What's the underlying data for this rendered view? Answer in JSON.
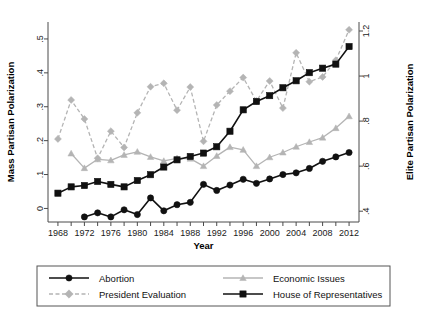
{
  "figure": {
    "background": "#ffffff"
  },
  "axes": {
    "left": {
      "title": "Mass Partisan Polarization",
      "ticks": [
        "0",
        ".1",
        ".2",
        ".3",
        ".4",
        ".5"
      ],
      "values": [
        0,
        0.1,
        0.2,
        0.3,
        0.4,
        0.5
      ],
      "min": -0.04,
      "max": 0.55
    },
    "right": {
      "title": "Elite Partisan Polarization",
      "ticks": [
        ".4",
        ".6",
        ".8",
        "1",
        "1.2"
      ],
      "values": [
        0.4,
        0.6,
        0.8,
        1.0,
        1.2
      ],
      "min": 0.352,
      "max": 1.24
    },
    "bottom": {
      "title": "Year",
      "ticks": [
        "1968",
        "1972",
        "1976",
        "1980",
        "1984",
        "1988",
        "1992",
        "1996",
        "2000",
        "2004",
        "2008",
        "2012"
      ],
      "values": [
        1968,
        1972,
        1976,
        1980,
        1984,
        1988,
        1992,
        1996,
        2000,
        2004,
        2008,
        2012
      ],
      "minor_step": 2,
      "min": 1966.5,
      "max": 2013.5
    }
  },
  "legend": {
    "items": [
      {
        "label": "Abortion",
        "color": "#111111",
        "marker": "circle",
        "dash": "solid",
        "axis": "left"
      },
      {
        "label": "Economic Issues",
        "color": "#b4b4b4",
        "marker": "triangle",
        "dash": "solid",
        "axis": "left"
      },
      {
        "label": "President Evaluation",
        "color": "#b4b4b4",
        "marker": "diamond",
        "dash": "dashed",
        "axis": "left"
      },
      {
        "label": "House of Representatives",
        "color": "#111111",
        "marker": "square",
        "dash": "solid",
        "axis": "right"
      }
    ]
  },
  "chart_data": {
    "type": "line",
    "title": "",
    "xlabel": "Year",
    "ylabel": "Mass Partisan Polarization",
    "y2label": "Elite Partisan Polarization",
    "xlim": [
      1966.5,
      2013.5
    ],
    "ylim": [
      -0.04,
      0.55
    ],
    "y2lim": [
      0.352,
      1.24
    ],
    "grid": false,
    "legend_position": "bottom",
    "x": [
      1968,
      1970,
      1972,
      1974,
      1976,
      1978,
      1980,
      1982,
      1984,
      1986,
      1988,
      1990,
      1992,
      1994,
      1996,
      1998,
      2000,
      2002,
      2004,
      2006,
      2008,
      2010,
      2012
    ],
    "series": [
      {
        "name": "Abortion",
        "axis": "left",
        "color": "#111111",
        "marker": "circle",
        "dash": "solid",
        "x": [
          1972,
          1974,
          1976,
          1978,
          1980,
          1982,
          1984,
          1986,
          1988,
          1990,
          1992,
          1994,
          1996,
          1998,
          2000,
          2002,
          2004,
          2006,
          2008,
          2010,
          2012
        ],
        "values": [
          -0.025,
          -0.013,
          -0.025,
          -0.004,
          -0.018,
          0.031,
          -0.007,
          0.011,
          0.018,
          0.071,
          0.053,
          0.069,
          0.086,
          0.074,
          0.087,
          0.1,
          0.105,
          0.118,
          0.139,
          0.152,
          0.165
        ]
      },
      {
        "name": "Economic Issues",
        "axis": "left",
        "color": "#b4b4b4",
        "marker": "triangle",
        "dash": "solid",
        "x": [
          1970,
          1972,
          1974,
          1976,
          1978,
          1980,
          1982,
          1984,
          1986,
          1988,
          1990,
          1992,
          1994,
          1996,
          1998,
          2000,
          2002,
          2004,
          2006,
          2008,
          2010,
          2012
        ],
        "values": [
          0.162,
          0.119,
          0.145,
          0.142,
          0.158,
          0.167,
          0.152,
          0.14,
          0.148,
          0.147,
          0.125,
          0.155,
          0.181,
          0.173,
          0.125,
          0.151,
          0.165,
          0.182,
          0.196,
          0.209,
          0.237,
          0.272
        ]
      },
      {
        "name": "President Evaluation",
        "axis": "left",
        "color": "#b4b4b4",
        "marker": "diamond",
        "dash": "dashed",
        "x": [
          1968,
          1970,
          1972,
          1974,
          1976,
          1978,
          1980,
          1982,
          1984,
          1986,
          1988,
          1990,
          1992,
          1994,
          1996,
          1998,
          2000,
          2002,
          2004,
          2006,
          2008,
          2010,
          2012
        ],
        "values": [
          0.205,
          0.32,
          0.264,
          0.148,
          0.228,
          0.18,
          0.282,
          0.359,
          0.369,
          0.29,
          0.358,
          0.198,
          0.305,
          0.346,
          0.386,
          0.317,
          0.376,
          0.296,
          0.459,
          0.374,
          0.388,
          0.437,
          0.527
        ]
      },
      {
        "name": "House of Representatives",
        "axis": "right",
        "color": "#111111",
        "marker": "square",
        "dash": "solid",
        "x": [
          1968,
          1970,
          1972,
          1974,
          1976,
          1978,
          1980,
          1982,
          1984,
          1986,
          1988,
          1990,
          1992,
          1994,
          1996,
          1998,
          2000,
          2002,
          2004,
          2006,
          2008,
          2010,
          2012
        ],
        "values_left_scale": [
          0.019,
          0.038,
          0.042,
          0.054,
          0.045,
          0.038,
          0.056,
          0.073,
          0.096,
          0.117,
          0.127,
          0.137,
          0.156,
          0.202,
          0.265,
          0.29,
          0.307,
          0.33,
          0.351,
          0.375,
          0.388,
          0.4,
          0.452
        ],
        "values": [
          0.48,
          0.508,
          0.514,
          0.532,
          0.519,
          0.508,
          0.536,
          0.562,
          0.596,
          0.628,
          0.643,
          0.658,
          0.686,
          0.755,
          0.85,
          0.887,
          0.913,
          0.948,
          0.979,
          1.015,
          1.035,
          1.053,
          1.131
        ]
      }
    ]
  }
}
